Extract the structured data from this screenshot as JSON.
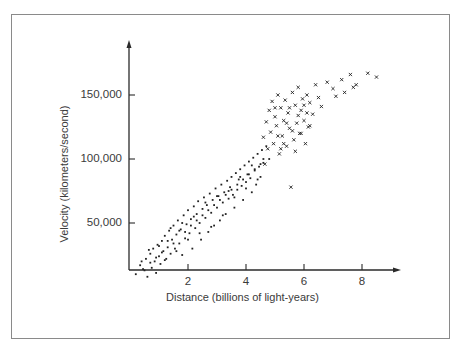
{
  "chart_data": {
    "type": "scatter",
    "title": "",
    "xlabel": "Distance (billions of light-years)",
    "ylabel": "Velocity (kilometers/second)",
    "x_ticks": [
      "2",
      "4",
      "6",
      "8"
    ],
    "y_ticks": [
      "50,000",
      "100,000",
      "150,000"
    ],
    "xlim": [
      0,
      9.3
    ],
    "ylim": [
      0,
      190000
    ],
    "grid": false,
    "legend": null,
    "series": [
      {
        "name": "dots",
        "marker": "dot",
        "points": [
          [
            0.2,
            10
          ],
          [
            0.35,
            17
          ],
          [
            0.5,
            13
          ],
          [
            0.55,
            22
          ],
          [
            0.6,
            8
          ],
          [
            0.7,
            26
          ],
          [
            0.75,
            15
          ],
          [
            0.8,
            30
          ],
          [
            0.85,
            20
          ],
          [
            0.9,
            11
          ],
          [
            0.95,
            33
          ],
          [
            1.0,
            24
          ],
          [
            1.05,
            18
          ],
          [
            1.1,
            36
          ],
          [
            1.15,
            28
          ],
          [
            1.2,
            40
          ],
          [
            1.25,
            22
          ],
          [
            1.3,
            31
          ],
          [
            1.35,
            44
          ],
          [
            1.4,
            26
          ],
          [
            1.45,
            37
          ],
          [
            1.5,
            48
          ],
          [
            1.55,
            30
          ],
          [
            1.6,
            41
          ],
          [
            1.65,
            52
          ],
          [
            1.7,
            34
          ],
          [
            1.75,
            45
          ],
          [
            1.8,
            25
          ],
          [
            1.85,
            56
          ],
          [
            1.9,
            38
          ],
          [
            1.95,
            49
          ],
          [
            2.0,
            60
          ],
          [
            2.05,
            42
          ],
          [
            2.1,
            53
          ],
          [
            2.15,
            30
          ],
          [
            2.2,
            63
          ],
          [
            2.25,
            46
          ],
          [
            2.3,
            57
          ],
          [
            2.35,
            67
          ],
          [
            2.4,
            50
          ],
          [
            2.45,
            37
          ],
          [
            2.5,
            61
          ],
          [
            2.55,
            70
          ],
          [
            2.6,
            54
          ],
          [
            2.65,
            64
          ],
          [
            2.7,
            43
          ],
          [
            2.75,
            73
          ],
          [
            2.8,
            58
          ],
          [
            2.85,
            68
          ],
          [
            2.9,
            48
          ],
          [
            2.95,
            77
          ],
          [
            3.0,
            62
          ],
          [
            3.05,
            71
          ],
          [
            3.1,
            52
          ],
          [
            3.15,
            80
          ],
          [
            3.2,
            66
          ],
          [
            3.25,
            74
          ],
          [
            3.3,
            57
          ],
          [
            3.35,
            83
          ],
          [
            3.4,
            69
          ],
          [
            3.45,
            78
          ],
          [
            3.5,
            86
          ],
          [
            3.55,
            72
          ],
          [
            3.6,
            62
          ],
          [
            3.65,
            89
          ],
          [
            3.7,
            76
          ],
          [
            3.75,
            84
          ],
          [
            3.8,
            92
          ],
          [
            3.85,
            79
          ],
          [
            3.9,
            68
          ],
          [
            3.95,
            95
          ],
          [
            4.0,
            82
          ],
          [
            4.05,
            88
          ],
          [
            4.1,
            98
          ],
          [
            4.15,
            85
          ],
          [
            4.2,
            74
          ],
          [
            4.25,
            101
          ],
          [
            4.3,
            91
          ],
          [
            4.35,
            80
          ],
          [
            4.4,
            104
          ],
          [
            4.45,
            94
          ],
          [
            4.5,
            86
          ],
          [
            4.55,
            107
          ],
          [
            4.6,
            97
          ],
          [
            4.7,
            110
          ],
          [
            4.8,
            100
          ],
          [
            0.4,
            20
          ],
          [
            0.65,
            29
          ],
          [
            0.9,
            23
          ],
          [
            1.1,
            27
          ],
          [
            1.3,
            36
          ],
          [
            1.5,
            34
          ],
          [
            1.7,
            44
          ],
          [
            1.9,
            43
          ],
          [
            2.1,
            48
          ],
          [
            2.3,
            52
          ],
          [
            2.5,
            56
          ],
          [
            2.7,
            60
          ],
          [
            2.9,
            64
          ],
          [
            3.1,
            68
          ],
          [
            3.3,
            72
          ],
          [
            3.5,
            76
          ],
          [
            3.7,
            80
          ],
          [
            3.9,
            84
          ],
          [
            4.1,
            88
          ],
          [
            4.3,
            92
          ],
          [
            4.5,
            96
          ],
          [
            0.45,
            14
          ],
          [
            0.7,
            19
          ],
          [
            1.0,
            32
          ],
          [
            1.2,
            21
          ],
          [
            1.4,
            46
          ],
          [
            1.6,
            28
          ],
          [
            1.8,
            50
          ],
          [
            2.0,
            37
          ],
          [
            2.2,
            55
          ],
          [
            2.4,
            42
          ],
          [
            2.6,
            66
          ],
          [
            2.8,
            47
          ],
          [
            3.0,
            71
          ],
          [
            3.2,
            56
          ],
          [
            3.4,
            75
          ],
          [
            3.6,
            70
          ],
          [
            3.8,
            86
          ],
          [
            4.0,
            77
          ],
          [
            4.2,
            95
          ],
          [
            4.4,
            84
          ],
          [
            4.6,
            100
          ]
        ]
      },
      {
        "name": "crosses",
        "marker": "x",
        "points": [
          [
            4.6,
            117
          ],
          [
            4.7,
            129
          ],
          [
            4.75,
            108
          ],
          [
            4.8,
            138
          ],
          [
            4.85,
            121
          ],
          [
            4.9,
            145
          ],
          [
            4.95,
            112
          ],
          [
            5.0,
            133
          ],
          [
            5.05,
            126
          ],
          [
            5.1,
            150
          ],
          [
            5.15,
            104
          ],
          [
            5.2,
            140
          ],
          [
            5.25,
            118
          ],
          [
            5.3,
            130
          ],
          [
            5.35,
            146
          ],
          [
            5.4,
            110
          ],
          [
            5.45,
            136
          ],
          [
            5.5,
            124
          ],
          [
            5.55,
            78
          ],
          [
            5.6,
            152
          ],
          [
            5.65,
            115
          ],
          [
            5.7,
            142
          ],
          [
            5.75,
            128
          ],
          [
            5.8,
            156
          ],
          [
            5.85,
            120
          ],
          [
            5.9,
            138
          ],
          [
            5.95,
            147
          ],
          [
            6.0,
            130
          ],
          [
            6.05,
            112
          ],
          [
            6.1,
            150
          ],
          [
            6.15,
            125
          ],
          [
            6.2,
            144
          ],
          [
            6.3,
            135
          ],
          [
            6.4,
            158
          ],
          [
            6.5,
            148
          ],
          [
            6.6,
            141
          ],
          [
            6.8,
            160
          ],
          [
            7.0,
            155
          ],
          [
            7.1,
            149
          ],
          [
            7.3,
            162
          ],
          [
            7.4,
            152
          ],
          [
            7.6,
            166
          ],
          [
            7.7,
            156
          ],
          [
            7.8,
            158
          ],
          [
            8.2,
            167
          ],
          [
            8.5,
            164
          ],
          [
            4.65,
            96
          ],
          [
            5.0,
            140
          ],
          [
            5.2,
            108
          ],
          [
            5.4,
            128
          ],
          [
            5.6,
            122
          ],
          [
            5.8,
            134
          ],
          [
            6.0,
            142
          ],
          [
            6.2,
            126
          ],
          [
            5.1,
            118
          ],
          [
            5.3,
            112
          ],
          [
            5.5,
            140
          ],
          [
            5.7,
            106
          ],
          [
            5.9,
            120
          ],
          [
            6.1,
            136
          ]
        ]
      }
    ]
  }
}
